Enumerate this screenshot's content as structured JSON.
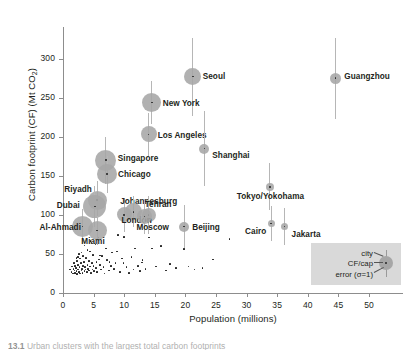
{
  "chart_data": {
    "type": "scatter",
    "title": "",
    "xlabel": "Population (millions)",
    "ylabel": "Carbon footprint (CF) (Mt CO2)",
    "ylabel_prefix": "Carbon footprint (CF) (Mt CO",
    "ylabel_sub": "2",
    "ylabel_suffix": ")",
    "xlim": [
      0,
      55.8
    ],
    "ylim": [
      0,
      340
    ],
    "xticks": [
      0,
      5,
      10,
      15,
      20,
      25,
      30,
      35,
      40,
      45,
      50
    ],
    "yticks": [
      0,
      50,
      100,
      150,
      200,
      250,
      300
    ],
    "grid": false,
    "legend_position": "bottom-right",
    "marker_size_encodes": "CF per capita",
    "error_bars": "vertical, sigma = 1",
    "labeled_cities": [
      {
        "name": "Guangzhou",
        "x": 44.5,
        "y": 275,
        "r": 5.5,
        "err": 52,
        "label_dx": 9,
        "label_dy": -1
      },
      {
        "name": "Seoul",
        "x": 21.2,
        "y": 277,
        "r": 8.5,
        "err": 50,
        "label_dx": 10,
        "label_dy": 0
      },
      {
        "name": "New York",
        "x": 14.5,
        "y": 244,
        "r": 9.5,
        "err": 27,
        "label_dx": 11,
        "label_dy": 2
      },
      {
        "name": "Los Angeles",
        "x": 14.0,
        "y": 203,
        "r": 8.0,
        "err": 28,
        "label_dx": 9,
        "label_dy": 2
      },
      {
        "name": "Shanghai",
        "x": 23.1,
        "y": 185,
        "r": 5.0,
        "err": 48,
        "label_dx": 8,
        "label_dy": 7
      },
      {
        "name": "Singapore",
        "x": 7.0,
        "y": 170,
        "r": 10.5,
        "err": 30,
        "label_dx": 12,
        "label_dy": -1
      },
      {
        "name": "Chicago",
        "x": 7.2,
        "y": 152,
        "r": 10.0,
        "err": 24,
        "label_dx": 11,
        "label_dy": 1
      },
      {
        "name": "Tokyo/Yokohama",
        "x": 33.8,
        "y": 136,
        "r": 4.0,
        "err": 30,
        "label_dx": -33,
        "label_dy": 10
      },
      {
        "name": "Riyadh",
        "x": 5.6,
        "y": 119,
        "r": 9.5,
        "err": 25,
        "label_dx": -33,
        "label_dy": -10
      },
      {
        "name": "Dubai",
        "x": 5.2,
        "y": 111,
        "r": 11.5,
        "err": 26,
        "label_dx": -38,
        "label_dy": 0
      },
      {
        "name": "Johannesburg",
        "x": 10.0,
        "y": 100,
        "r": 7.5,
        "err": 22,
        "label_dx": -4,
        "label_dy": -13
      },
      {
        "name": "Tehran",
        "x": 14.0,
        "y": 100,
        "r": 7.0,
        "err": 24,
        "label_dx": -4,
        "label_dy": -10
      },
      {
        "name": "London",
        "x": 11.5,
        "y": 104,
        "r": 8.5,
        "err": 20,
        "label_dx": -12,
        "label_dy": 9
      },
      {
        "name": "Moscow",
        "x": 13.3,
        "y": 98,
        "r": 7.5,
        "err": 22,
        "label_dx": -8,
        "label_dy": 12
      },
      {
        "name": "Al-Ahmadi",
        "x": 3.2,
        "y": 85,
        "r": 10.5,
        "err": 22,
        "label_dx": -43,
        "label_dy": 1
      },
      {
        "name": "Miami",
        "x": 5.6,
        "y": 80,
        "r": 9.5,
        "err": 18,
        "label_dx": -16,
        "label_dy": 11
      },
      {
        "name": "Beijing",
        "x": 19.8,
        "y": 85,
        "r": 5.0,
        "err": 28,
        "label_dx": 8,
        "label_dy": 1
      },
      {
        "name": "Cairo",
        "x": 34.0,
        "y": 89,
        "r": 3.5,
        "err": 22,
        "label_dx": -26,
        "label_dy": 9
      },
      {
        "name": "Jakarta",
        "x": 36.2,
        "y": 85,
        "r": 3.5,
        "err": 24,
        "label_dx": 7,
        "label_dy": 8
      }
    ],
    "unlabeled_points": [
      [
        1.2,
        30
      ],
      [
        1.4,
        27
      ],
      [
        1.5,
        34
      ],
      [
        1.6,
        25
      ],
      [
        1.7,
        31
      ],
      [
        1.8,
        38
      ],
      [
        1.9,
        29
      ],
      [
        2.0,
        26
      ],
      [
        2.0,
        35
      ],
      [
        2.1,
        32
      ],
      [
        2.2,
        28
      ],
      [
        2.3,
        41
      ],
      [
        2.3,
        24
      ],
      [
        2.4,
        36
      ],
      [
        2.5,
        30
      ],
      [
        2.5,
        46
      ],
      [
        2.6,
        27
      ],
      [
        2.7,
        33
      ],
      [
        2.8,
        25
      ],
      [
        2.8,
        44
      ],
      [
        2.9,
        38
      ],
      [
        3.0,
        29
      ],
      [
        3.0,
        52
      ],
      [
        3.1,
        31
      ],
      [
        3.2,
        26
      ],
      [
        3.3,
        35
      ],
      [
        3.4,
        40
      ],
      [
        3.5,
        28
      ],
      [
        3.5,
        61
      ],
      [
        3.6,
        33
      ],
      [
        3.7,
        30
      ],
      [
        3.8,
        45
      ],
      [
        3.9,
        27
      ],
      [
        4.0,
        36
      ],
      [
        4.0,
        55
      ],
      [
        4.1,
        31
      ],
      [
        4.2,
        41
      ],
      [
        4.3,
        29
      ],
      [
        4.4,
        34
      ],
      [
        4.5,
        67
      ],
      [
        4.6,
        26
      ],
      [
        4.7,
        38
      ],
      [
        4.8,
        30
      ],
      [
        4.9,
        49
      ],
      [
        5.0,
        35
      ],
      [
        5.1,
        28
      ],
      [
        5.3,
        62
      ],
      [
        5.4,
        32
      ],
      [
        5.5,
        40
      ],
      [
        5.6,
        27
      ],
      [
        5.8,
        71
      ],
      [
        6.0,
        36
      ],
      [
        6.2,
        30
      ],
      [
        6.4,
        47
      ],
      [
        6.6,
        33
      ],
      [
        6.8,
        25
      ],
      [
        7.0,
        57
      ],
      [
        7.2,
        42
      ],
      [
        7.5,
        29
      ],
      [
        7.8,
        35
      ],
      [
        8.0,
        52
      ],
      [
        8.3,
        31
      ],
      [
        8.6,
        38
      ],
      [
        9.0,
        74
      ],
      [
        9.3,
        27
      ],
      [
        9.6,
        44
      ],
      [
        10.0,
        72
      ],
      [
        10.4,
        33
      ],
      [
        10.8,
        26
      ],
      [
        11.2,
        46
      ],
      [
        11.5,
        30
      ],
      [
        11.8,
        57
      ],
      [
        12.2,
        35
      ],
      [
        12.6,
        28
      ],
      [
        13.0,
        42
      ],
      [
        13.5,
        31
      ],
      [
        14.0,
        71
      ],
      [
        14.5,
        57
      ],
      [
        15.2,
        34
      ],
      [
        16.0,
        60
      ],
      [
        16.8,
        29
      ],
      [
        17.5,
        37
      ],
      [
        18.5,
        32
      ],
      [
        19.8,
        56
      ],
      [
        20.5,
        34
      ],
      [
        21.5,
        30
      ],
      [
        22.8,
        32
      ],
      [
        24.5,
        43
      ],
      [
        27.2,
        69
      ],
      [
        8.8,
        53
      ],
      [
        9.9,
        38
      ],
      [
        6.1,
        48
      ],
      [
        4.4,
        53
      ],
      [
        3.3,
        47
      ],
      [
        2.6,
        50
      ],
      [
        5.9,
        43
      ],
      [
        7.6,
        40
      ],
      [
        12.9,
        39
      ],
      [
        2.2,
        45
      ]
    ],
    "legend": {
      "city_label": "city",
      "cfcap_label": "CF/cap",
      "error_label": "error (σ=1)"
    }
  },
  "caption": {
    "figure_number": "13.1",
    "text": "Urban clusters with the largest total carbon footprints"
  }
}
